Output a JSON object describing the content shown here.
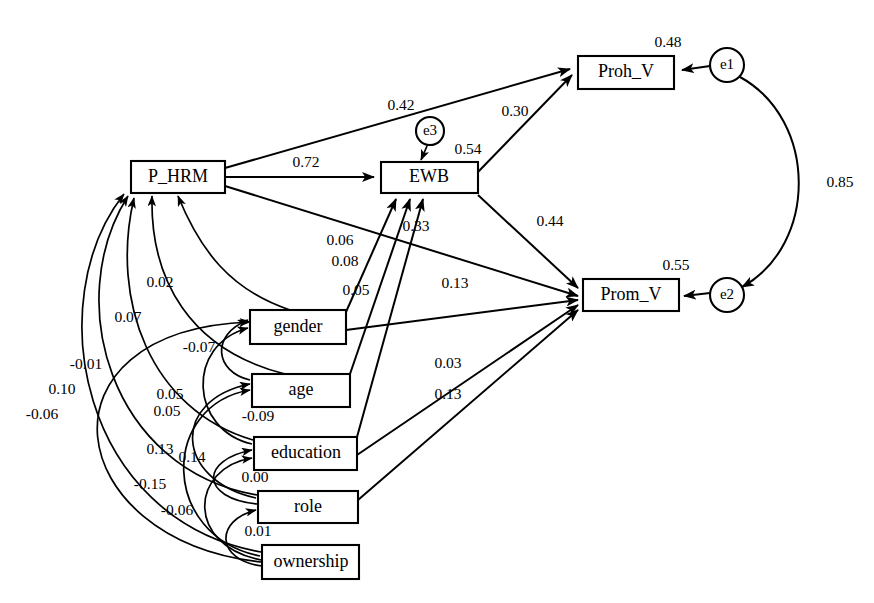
{
  "figure": {
    "type": "path-diagram"
  },
  "nodes": {
    "latent": [
      {
        "id": "P_HRM",
        "label": "P_HRM",
        "x": 131,
        "y": 161,
        "w": 94,
        "h": 32
      },
      {
        "id": "EWB",
        "label": "EWB",
        "x": 381,
        "y": 162,
        "w": 97,
        "h": 31
      },
      {
        "id": "Proh_V",
        "label": "Proh_V",
        "x": 578,
        "y": 56,
        "w": 96,
        "h": 33
      },
      {
        "id": "Prom_V",
        "label": "Prom_V",
        "x": 583,
        "y": 279,
        "w": 96,
        "h": 32
      }
    ],
    "observed": [
      {
        "id": "gender",
        "label": "gender",
        "x": 250,
        "y": 310,
        "w": 96,
        "h": 34
      },
      {
        "id": "age",
        "label": "age",
        "x": 252,
        "y": 374,
        "w": 98,
        "h": 33
      },
      {
        "id": "education",
        "label": "education",
        "x": 254,
        "y": 437,
        "w": 103,
        "h": 33
      },
      {
        "id": "role",
        "label": "role",
        "x": 258,
        "y": 491,
        "w": 100,
        "h": 32
      },
      {
        "id": "ownership",
        "label": "ownership",
        "x": 262,
        "y": 545,
        "w": 97,
        "h": 34
      }
    ],
    "errors": [
      {
        "id": "e1",
        "label": "e1",
        "cx": 727,
        "cy": 65,
        "r": 17
      },
      {
        "id": "e2",
        "label": "e2",
        "cx": 727,
        "cy": 295,
        "r": 17
      },
      {
        "id": "e3",
        "label": "e3",
        "cx": 430,
        "cy": 131,
        "r": 14
      }
    ]
  },
  "squared_multiple_correlations": [
    {
      "for": "Proh_V",
      "value": "0.48",
      "x": 668,
      "y": 43
    },
    {
      "for": "EWB",
      "value": "0.54",
      "x": 468,
      "y": 150
    },
    {
      "for": "Prom_V",
      "value": "0.55",
      "x": 676,
      "y": 266
    }
  ],
  "structural_paths": [
    {
      "from": "P_HRM",
      "to": "Proh_V",
      "value": "0.42",
      "lx": 401,
      "ly": 106
    },
    {
      "from": "EWB",
      "to": "Proh_V",
      "value": "0.30",
      "lx": 515,
      "ly": 112
    },
    {
      "from": "P_HRM",
      "to": "EWB",
      "value": "0.72",
      "lx": 306,
      "ly": 163
    },
    {
      "from": "EWB",
      "to": "Prom_V",
      "value": "0.44",
      "lx": 550,
      "ly": 222
    },
    {
      "from": "P_HRM",
      "to": "Prom_V",
      "value": "0.06",
      "lx": 340,
      "ly": 241
    },
    {
      "from": "education",
      "to": "EWB",
      "value": "0.33",
      "lx": 416,
      "ly": 227
    },
    {
      "from": "gender",
      "to": "EWB",
      "value": "0.08",
      "lx": 345,
      "ly": 262
    },
    {
      "from": "age",
      "to": "EWB",
      "value": "0.05",
      "lx": 356,
      "ly": 291
    },
    {
      "from": "role",
      "to": "Prom_V",
      "value": "0.13",
      "lx": 455,
      "ly": 284
    },
    {
      "from": "education",
      "to": "Prom_V",
      "value": "0.03",
      "lx": 448,
      "ly": 364
    },
    {
      "from": "role",
      "to": "Prom_V",
      "value": "0.13",
      "lx": 448,
      "ly": 395
    }
  ],
  "covariances": [
    {
      "between": "e1 <-> e2",
      "value": "0.85",
      "lx": 840,
      "ly": 183
    },
    {
      "between": "P_HRM <-> gender",
      "value": "0.02",
      "lx": 160,
      "ly": 283
    },
    {
      "between": "P_HRM <-> age",
      "value": "0.07",
      "lx": 128,
      "ly": 318
    },
    {
      "between": "P_HRM <-> education",
      "value": "-0.07",
      "lx": 199,
      "ly": 348
    },
    {
      "between": "P_HRM <-> role",
      "value": "-0.01",
      "lx": 86,
      "ly": 365
    },
    {
      "between": "P_HRM <-> ownership",
      "value": "0.10",
      "lx": 62,
      "ly": 390
    },
    {
      "between": "gender <-> ownership",
      "value": "-0.06",
      "lx": 42,
      "ly": 415
    },
    {
      "between": "gender <-> age",
      "value": "0.05",
      "lx": 170,
      "ly": 395
    },
    {
      "between": "gender <-> education",
      "value": "0.05",
      "lx": 167,
      "ly": 412
    },
    {
      "between": "age <-> role",
      "value": "0.13",
      "lx": 160,
      "ly": 450
    },
    {
      "between": "age <-> ownership",
      "value": "0.14",
      "lx": 192,
      "ly": 458
    },
    {
      "between": "education <-> role",
      "value": "-0.15",
      "lx": 150,
      "ly": 485
    },
    {
      "between": "role <-> ownership",
      "value": "-0.06",
      "lx": 177,
      "ly": 511
    },
    {
      "between": "gender <-> age adj",
      "value": "-0.09",
      "lx": 258,
      "ly": 417
    },
    {
      "between": "education <-> role adj",
      "value": "0.00",
      "lx": 255,
      "ly": 478
    },
    {
      "between": "role <-> ownership adj",
      "value": "0.01",
      "lx": 258,
      "ly": 532
    }
  ],
  "colors": {
    "stroke": "#000000",
    "fill": "#ffffff"
  }
}
